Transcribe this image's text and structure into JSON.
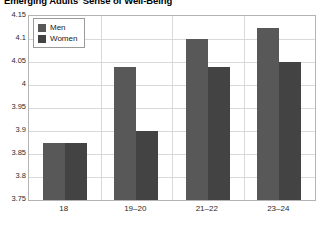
{
  "chart_data": {
    "type": "bar",
    "title": "Emerging Adults' Sense of Well-Being",
    "xlabel": "",
    "ylabel": "",
    "categories": [
      "18",
      "19–20",
      "21–22",
      "23–24"
    ],
    "series": [
      {
        "name": "Men",
        "color": "#585858",
        "values": [
          3.875,
          4.04,
          4.1,
          4.125
        ]
      },
      {
        "name": "Women",
        "color": "#434343",
        "values": [
          3.875,
          3.9,
          4.04,
          4.05
        ]
      }
    ],
    "ylim": [
      3.75,
      4.15
    ],
    "ytick_step": 0.05,
    "yticks": [
      "4.15",
      "4.1",
      "4.05",
      "4",
      "3.95",
      "3.9",
      "3.85",
      "3.8",
      "3.75"
    ],
    "ytick_values": [
      4.15,
      4.1,
      4.05,
      4.0,
      3.95,
      3.9,
      3.85,
      3.8,
      3.75
    ],
    "grid": true,
    "grid_axis": "both",
    "legend": [
      "Men",
      "Women"
    ],
    "legend_position": "top-left-inside"
  },
  "legend": {
    "items": [
      {
        "label": "Men"
      },
      {
        "label": "Women"
      }
    ]
  }
}
